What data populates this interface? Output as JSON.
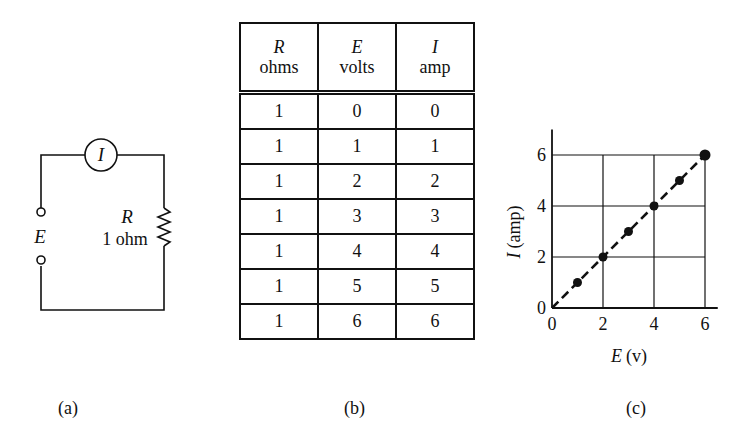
{
  "panel_a": {
    "ammeter_label": "I",
    "source_label": "E",
    "resistor_symbol": "R",
    "resistor_value": "1 ohm",
    "caption": "(a)"
  },
  "panel_b": {
    "headers": [
      {
        "symbol": "R",
        "unit": "ohms"
      },
      {
        "symbol": "E",
        "unit": "volts"
      },
      {
        "symbol": "I",
        "unit": "amp"
      }
    ],
    "rows": [
      [
        "1",
        "0",
        "0"
      ],
      [
        "1",
        "1",
        "1"
      ],
      [
        "1",
        "2",
        "2"
      ],
      [
        "1",
        "3",
        "3"
      ],
      [
        "1",
        "4",
        "4"
      ],
      [
        "1",
        "5",
        "5"
      ],
      [
        "1",
        "6",
        "6"
      ]
    ],
    "caption": "(b)"
  },
  "panel_c": {
    "xlabel_symbol": "E",
    "xlabel_unit": "(v)",
    "ylabel_symbol": "I",
    "ylabel_unit": "(amp)",
    "x_ticks": [
      "0",
      "2",
      "4",
      "6"
    ],
    "y_ticks": [
      "0",
      "2",
      "4",
      "6"
    ],
    "caption": "(c)"
  },
  "chart_data": {
    "type": "scatter",
    "title": "",
    "xlabel": "E (v)",
    "ylabel": "I (amp)",
    "x": [
      0,
      1,
      2,
      3,
      4,
      5,
      6
    ],
    "series": [
      {
        "name": "I vs E (R = 1 ohm)",
        "values": [
          0,
          1,
          2,
          3,
          4,
          5,
          6
        ]
      }
    ],
    "fit_line": {
      "style": "dashed",
      "from": [
        0,
        0
      ],
      "to": [
        6,
        6
      ]
    },
    "xlim": [
      0,
      6.5
    ],
    "ylim": [
      0,
      7
    ],
    "x_ticks": [
      0,
      2,
      4,
      6
    ],
    "y_ticks": [
      0,
      2,
      4,
      6
    ],
    "grid": true,
    "legend": "none"
  }
}
